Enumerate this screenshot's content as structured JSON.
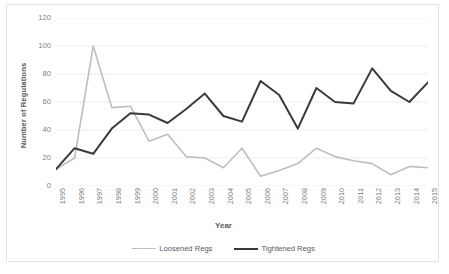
{
  "chart_data": {
    "type": "line",
    "title": "",
    "xlabel": "Year",
    "ylabel": "Number of Regulations",
    "grid": true,
    "legend_position": "bottom",
    "ylim": [
      0,
      120
    ],
    "yticks": [
      0,
      20,
      40,
      60,
      80,
      100,
      120
    ],
    "categories": [
      "1995",
      "1996",
      "1997",
      "1998",
      "1999",
      "2000",
      "2001",
      "2002",
      "2003",
      "2004",
      "2005",
      "2006",
      "2007",
      "2008",
      "2009",
      "2010",
      "2011",
      "2012",
      "2013",
      "2014",
      "2015"
    ],
    "series": [
      {
        "name": "Loosened Regs",
        "color": "#bfbfbf",
        "values": [
          12,
          20,
          100,
          56,
          57,
          32,
          37,
          21,
          20,
          13,
          27,
          7,
          11,
          16,
          27,
          21,
          18,
          16,
          8,
          14,
          13
        ]
      },
      {
        "name": "Tightened Regs",
        "color": "#3a3a3a",
        "values": [
          12,
          27,
          23,
          41,
          52,
          51,
          45,
          55,
          66,
          50,
          46,
          75,
          65,
          41,
          70,
          60,
          59,
          84,
          68,
          60,
          74
        ]
      }
    ]
  },
  "axes": {
    "y_title": "Number of Regulations",
    "x_title": "Year",
    "y_tick_labels": [
      "0",
      "20",
      "40",
      "60",
      "80",
      "100",
      "120"
    ],
    "x_tick_labels": [
      "1995",
      "1996",
      "1997",
      "1998",
      "1999",
      "2000",
      "2001",
      "2002",
      "2003",
      "2004",
      "2005",
      "2006",
      "2007",
      "2008",
      "2009",
      "2010",
      "2011",
      "2012",
      "2013",
      "2014",
      "2015"
    ]
  },
  "legend": {
    "items": [
      {
        "label": "Loosened Regs",
        "color": "#bfbfbf"
      },
      {
        "label": "Tightened Regs",
        "color": "#3a3a3a"
      }
    ]
  },
  "colors": {
    "grid": "#ededed",
    "frame": "#e3e3e3",
    "tick_text": "#808080",
    "title_text": "#595959",
    "background": "#ffffff"
  }
}
